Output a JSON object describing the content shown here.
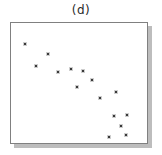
{
  "figure": {
    "title": "(d)"
  },
  "colors": {
    "background": "#ffffff",
    "box_fill": "#ffffff",
    "box_border": "#808080",
    "box_shadow": "#bdbdbd",
    "point": "#3a3a3a",
    "title_text": "#2b2b2b"
  },
  "chart_data": {
    "type": "scatter",
    "title": "(d)",
    "subtitle": "",
    "xlabel": "",
    "ylabel": "",
    "xlim": [
      0,
      100
    ],
    "ylim": [
      0,
      100
    ],
    "grid": false,
    "axes_ticks_visible": false,
    "legend": null,
    "frame_style": "plain box with gray drop shadow, no axis ticks or labels",
    "trend": "negative correlation, points descend from upper-left to lower-right",
    "marker": {
      "shape": "square",
      "size_px": 2,
      "color": "#3a3a3a"
    },
    "points": [
      {
        "x": 10.1,
        "y": 82.8
      },
      {
        "x": 27.5,
        "y": 73.8
      },
      {
        "x": 18.1,
        "y": 63.9
      },
      {
        "x": 34.8,
        "y": 59.0
      },
      {
        "x": 44.2,
        "y": 61.9
      },
      {
        "x": 52.9,
        "y": 60.2
      },
      {
        "x": 59.4,
        "y": 52.5
      },
      {
        "x": 48.6,
        "y": 46.3
      },
      {
        "x": 65.2,
        "y": 37.3
      },
      {
        "x": 77.5,
        "y": 42.6
      },
      {
        "x": 75.4,
        "y": 22.1
      },
      {
        "x": 85.1,
        "y": 23.4
      },
      {
        "x": 81.2,
        "y": 14.3
      },
      {
        "x": 71.7,
        "y": 5.3
      },
      {
        "x": 84.8,
        "y": 7.0
      }
    ]
  }
}
